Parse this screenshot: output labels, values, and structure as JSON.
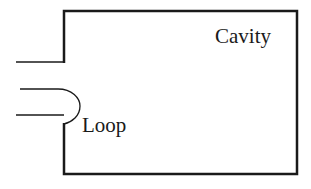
{
  "diagram": {
    "labels": {
      "cavity": "Cavity",
      "loop": "Loop"
    },
    "colors": {
      "stroke": "#1a1a1a",
      "background": "#ffffff"
    }
  }
}
